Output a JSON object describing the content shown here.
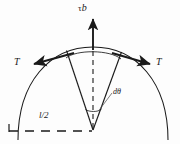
{
  "figure": {
    "type": "mechanics-diagram",
    "background_color": "#fdfdfd",
    "stroke_color": "#1a1a1a",
    "labels": {
      "force_resultant_tau": "τ",
      "force_resultant_b": "b",
      "line_tension_left": "T",
      "line_tension_right": "T",
      "angle_increment": "dθ",
      "half_length": "l/2"
    },
    "geometry": {
      "apex_x": 93,
      "apex_y": 130,
      "arc_top_x": 93,
      "arc_top_y": 47,
      "arc_left_end_x": 18,
      "arc_left_end_y": 136,
      "arc_right_end_x": 168,
      "arc_right_end_y": 136,
      "wedge_left_x": 66,
      "wedge_left_y": 50,
      "wedge_right_x": 122,
      "wedge_right_y": 52,
      "angle_arc_y": 110,
      "baseline_y": 131,
      "baseline_start_x": 8,
      "baseline_end_x": 93,
      "tau_arrow_tip_y": 16
    }
  }
}
